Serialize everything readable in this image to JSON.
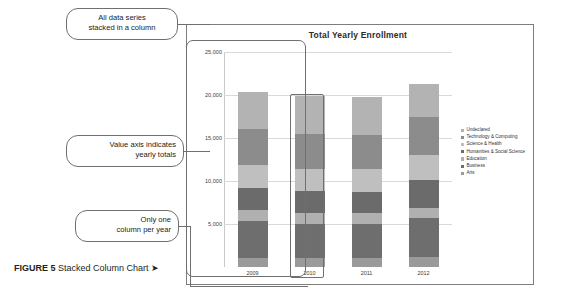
{
  "figure": {
    "caption_label": "FIGURE 5",
    "caption_text": " Stacked Column Chart ",
    "caption_arrow": "➤"
  },
  "chart_title": "Total Yearly Enrollment",
  "callouts": [
    {
      "id": "callout-series",
      "text": "All data series\nstacked in a column"
    },
    {
      "id": "callout-axis",
      "text": "Value axis indicates\nyearly totals"
    },
    {
      "id": "callout-column",
      "text": "Only one\ncolumn per year"
    }
  ],
  "callout_lines": {
    "series_line1": "All data series",
    "series_line2": "stacked in a column",
    "axis_line1": "Value axis indicates",
    "axis_line2": "yearly totals",
    "column_line1": "Only one",
    "column_line2": "column per year"
  },
  "colors": {
    "undeclared": "#b3b3b3",
    "technology": "#8c8c8c",
    "science": "#bfbfbf",
    "humanities": "#6b6b6b",
    "education": "#b0b0b0",
    "business": "#6e6e6e",
    "arts": "#9a9a9a",
    "gridline": "#d9d9d9",
    "frame": "#7d7d7d"
  },
  "chart_data": {
    "type": "bar",
    "subtype": "stacked-column",
    "title": "Total Yearly Enrollment",
    "xlabel": "",
    "ylabel": "",
    "categories": [
      "2009",
      "2010",
      "2011",
      "2012"
    ],
    "ylim": [
      0,
      25000
    ],
    "yticks": [
      5000,
      10000,
      15000,
      20000,
      25000
    ],
    "ytick_labels": [
      "5,000",
      "10,000",
      "15,000",
      "20,000",
      "25,000"
    ],
    "grid": true,
    "legend_position": "right",
    "totals": [
      20300,
      19900,
      19800,
      21300
    ],
    "series": [
      {
        "name": "Arts",
        "color": "#9a9a9a",
        "values": [
          1100,
          1050,
          1000,
          1150
        ]
      },
      {
        "name": "Business",
        "color": "#6e6e6e",
        "values": [
          4200,
          4000,
          4050,
          4500
        ]
      },
      {
        "name": "Education",
        "color": "#b0b0b0",
        "values": [
          1300,
          1250,
          1200,
          1250
        ]
      },
      {
        "name": "Humanities & Social Science",
        "color": "#6b6b6b",
        "values": [
          2600,
          2550,
          2500,
          3200
        ]
      },
      {
        "name": "Science & Health",
        "color": "#bfbfbf",
        "values": [
          2700,
          2600,
          2600,
          2900
        ]
      },
      {
        "name": "Technology & Computing",
        "color": "#8c8c8c",
        "values": [
          4100,
          4000,
          4050,
          4400
        ]
      },
      {
        "name": "Undeclared",
        "color": "#b3b3b3",
        "values": [
          4300,
          4450,
          4400,
          3900
        ]
      }
    ]
  },
  "legend": {
    "items": [
      {
        "label": "Undeclared",
        "color": "#b3b3b3"
      },
      {
        "label": "Technology & Computing",
        "color": "#8c8c8c"
      },
      {
        "label": "Science & Health",
        "color": "#bfbfbf"
      },
      {
        "label": "Humanities & Social Science",
        "color": "#6b6b6b"
      },
      {
        "label": "Education",
        "color": "#b0b0b0"
      },
      {
        "label": "Business",
        "color": "#6e6e6e"
      },
      {
        "label": "Arts",
        "color": "#9a9a9a"
      }
    ]
  }
}
